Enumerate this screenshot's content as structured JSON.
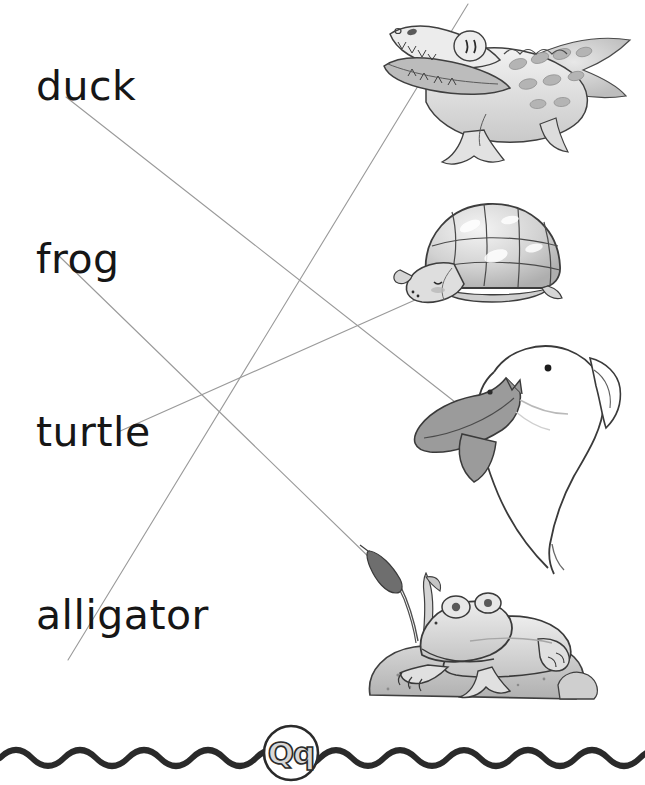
{
  "worksheet": {
    "type": "matching-worksheet",
    "letter": "Qq",
    "instruction_text": "",
    "ink_color": "#9a9a9a",
    "text_color": "#161616"
  },
  "words": [
    {
      "id": "duck",
      "label": "duck",
      "index": 1
    },
    {
      "id": "frog",
      "label": "frog",
      "index": 2
    },
    {
      "id": "turtle",
      "label": "turtle",
      "index": 3
    },
    {
      "id": "alligator",
      "label": "alligator",
      "index": 4
    }
  ],
  "pictures": [
    {
      "id": "alligator",
      "name": "alligator-illustration",
      "alt": "alligator with open mouth",
      "index": 1
    },
    {
      "id": "turtle",
      "name": "turtle-illustration",
      "alt": "turtle with shell",
      "index": 2
    },
    {
      "id": "duck",
      "name": "duck-illustration",
      "alt": "duck with dark wing",
      "index": 3
    },
    {
      "id": "frog",
      "name": "frog-illustration",
      "alt": "frog on a rock with cattail",
      "index": 4
    }
  ],
  "connections": [
    {
      "from": "duck",
      "to": "duck",
      "x1": 66,
      "y1": 97,
      "x2": 455,
      "y2": 402
    },
    {
      "from": "frog",
      "to": "frog",
      "x1": 58,
      "y1": 255,
      "x2": 374,
      "y2": 562
    },
    {
      "from": "turtle",
      "to": "turtle",
      "x1": 118,
      "y1": 432,
      "x2": 424,
      "y2": 296
    },
    {
      "from": "alligator",
      "to": "alligator",
      "x1": 68,
      "y1": 660,
      "x2": 468,
      "y2": 4
    }
  ],
  "footer": {
    "badge_letter": "Qq",
    "wave_color": "#2a2a2a"
  }
}
